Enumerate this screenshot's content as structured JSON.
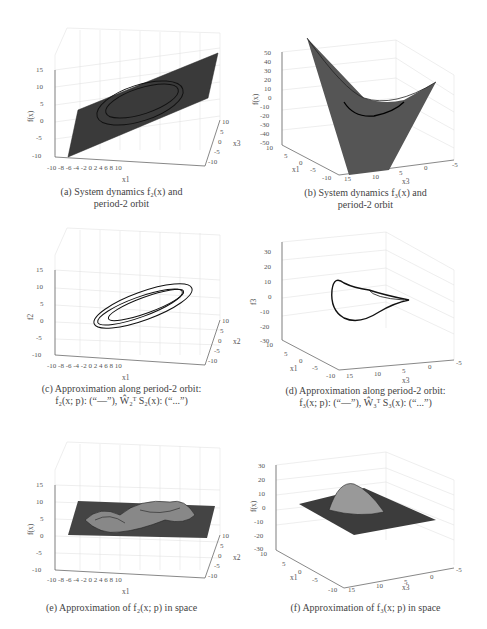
{
  "figure": {
    "panels": [
      {
        "id": "a",
        "caption_line1": "(a) System dynamics f₂(x) and",
        "caption_line2": "period-2 orbit",
        "zlabel": "f(x)",
        "xlabel": "x1",
        "ylabel": "x3",
        "zticks": [
          "15",
          "10",
          "5",
          "0",
          "-5",
          "-10"
        ],
        "xticks": [
          "-10",
          "-8",
          "-6",
          "-4",
          "-2",
          "0",
          "2",
          "4",
          "6",
          "8",
          "10"
        ],
        "yticks": [
          "10",
          "5",
          "0",
          "-5",
          "-10"
        ]
      },
      {
        "id": "b",
        "caption_line1": "(b) System dynamics f₃(x) and",
        "caption_line2": "period-2 orbit",
        "zlabel": "f(x)",
        "xlabel": "x1",
        "ylabel": "x3",
        "zticks": [
          "50",
          "40",
          "30",
          "20",
          "10",
          "0",
          "-10",
          "-20",
          "-30",
          "-40",
          "-50"
        ],
        "xticks": [
          "10",
          "5",
          "0",
          "-5",
          "-10"
        ],
        "yticks": [
          "15",
          "10",
          "5",
          "0",
          "-5"
        ]
      },
      {
        "id": "c",
        "caption_line1": "(c) Approximation along period-2 orbit:",
        "caption_line2": "f₂(x; p): (“—”), Ŵ₂ᵀ S₂(x): (“...”)",
        "zlabel": "f2",
        "xlabel": "x1",
        "ylabel": "x2",
        "zticks": [
          "15",
          "10",
          "5",
          "0",
          "-5",
          "-10"
        ],
        "xticks": [
          "-10",
          "-8",
          "-6",
          "-4",
          "-2",
          "0",
          "2",
          "4",
          "6",
          "8",
          "10"
        ],
        "yticks": [
          "10",
          "5",
          "0",
          "-5",
          "-10"
        ]
      },
      {
        "id": "d",
        "caption_line1": "(d) Approximation along period-2 orbit:",
        "caption_line2": "f₃(x; p): (“—”), Ŵ₃ᵀ S₃(x): (“...”)",
        "zlabel": "f3",
        "xlabel": "x1",
        "ylabel": "x3",
        "zticks": [
          "30",
          "20",
          "10",
          "0",
          "-10",
          "-20",
          "-30"
        ],
        "xticks": [
          "10",
          "5",
          "0",
          "-5",
          "-10"
        ],
        "yticks": [
          "15",
          "10",
          "5",
          "0",
          "-5"
        ]
      },
      {
        "id": "e",
        "caption_line1": "(e) Approximation of f₂(x; p) in space",
        "caption_line2": "",
        "zlabel": "f(x)",
        "xlabel": "x1",
        "ylabel": "x2",
        "zticks": [
          "15",
          "10",
          "5",
          "0",
          "-5",
          "-10"
        ],
        "xticks": [
          "-10",
          "-8",
          "-6",
          "-4",
          "-2",
          "0",
          "2",
          "4",
          "6",
          "8",
          "10"
        ],
        "yticks": [
          "10",
          "5",
          "0",
          "-5",
          "-10"
        ]
      },
      {
        "id": "f",
        "caption_line1": "(f) Approximation of f₃(x; p) in space",
        "caption_line2": "",
        "zlabel": "f(x)",
        "xlabel": "x1",
        "ylabel": "x3",
        "zticks": [
          "30",
          "20",
          "10",
          "0",
          "-10",
          "-20",
          "-30"
        ],
        "xticks": [
          "10",
          "5",
          "0",
          "-5",
          "-10"
        ],
        "yticks": [
          "15",
          "10",
          "5",
          "0",
          "-5"
        ]
      }
    ]
  }
}
